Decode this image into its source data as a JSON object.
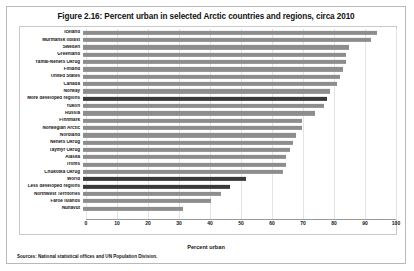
{
  "figure": {
    "title": "Figure 2.16: Percent urban in selected Arctic countries and regions, circa 2010",
    "source_note": "Sources: National statistical offices and UN Population Division."
  },
  "chart_data": {
    "type": "bar",
    "orientation": "horizontal",
    "title": "Figure 2.16: Percent urban in selected Arctic countries and regions, circa 2010",
    "xlabel": "Percent urban",
    "ylabel": "",
    "xlim": [
      0,
      100
    ],
    "xticks": [
      "0",
      "10",
      "20",
      "30",
      "40",
      "50",
      "60",
      "70",
      "80",
      "90",
      "100"
    ],
    "grid": true,
    "legend": "none",
    "bar_color": "#8d8d8d",
    "highlight_color": "#3a3a3a",
    "categories": [
      "Iceland",
      "Murmansk oblast",
      "Sweden",
      "Greenland",
      "Yamal-Nenets Okrug",
      "Finland",
      "United States",
      "Canada",
      "Norway",
      "More developed regions",
      "Yukon",
      "Russia",
      "Finnmark",
      "Norwegian Arctic",
      "Nordland",
      "Nenets Okrug",
      "Taymyr Okrug",
      "Alaska",
      "Troms",
      "Chukotka Okrug",
      "World",
      "Less developed regions",
      "Northwest Territories",
      "Faroe Islands",
      "Nunavut"
    ],
    "values": [
      94,
      92,
      85,
      84,
      84,
      83,
      82,
      81,
      79,
      78,
      77,
      74,
      70,
      70,
      68,
      67,
      66,
      65,
      65,
      64,
      52,
      47,
      44,
      41,
      32
    ],
    "highlighted": [
      "More developed regions",
      "World",
      "Less developed regions"
    ]
  }
}
